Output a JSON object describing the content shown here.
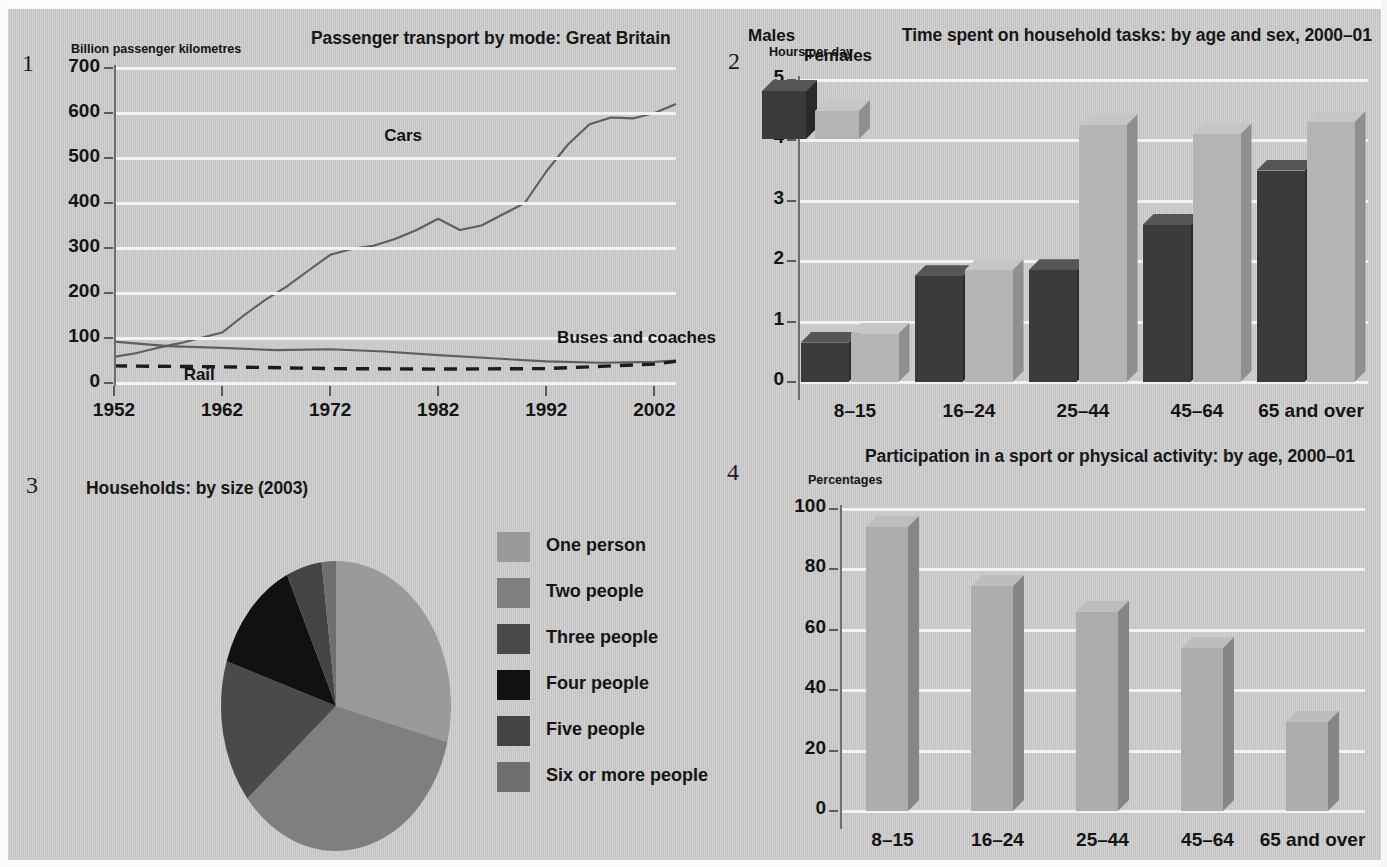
{
  "page": {
    "background_color": "#c9c9c9",
    "text_color": "#161616"
  },
  "panels": [
    {
      "number": "1"
    },
    {
      "number": "2"
    },
    {
      "number": "3"
    },
    {
      "number": "4"
    }
  ],
  "chart_data": [
    {
      "panel": "1",
      "type": "line",
      "title": "Passenger transport by mode: Great Britain",
      "ylabel": "Billion passenger kilometres",
      "xlabel": "",
      "ylim": [
        0,
        700
      ],
      "yticks": [
        "0",
        "100",
        "200",
        "300",
        "400",
        "500",
        "600",
        "700"
      ],
      "xticks": [
        "1952",
        "1962",
        "1972",
        "1982",
        "1992",
        "2002"
      ],
      "grid": true,
      "legend_position": "inline-annotations",
      "series": [
        {
          "name": "Cars",
          "style": "solid",
          "color": "#5e5e5e",
          "x": [
            1952,
            1954,
            1956,
            1958,
            1960,
            1962,
            1964,
            1966,
            1968,
            1970,
            1972,
            1974,
            1976,
            1978,
            1980,
            1982,
            1984,
            1986,
            1988,
            1990,
            1992,
            1994,
            1996,
            1998,
            2000,
            2002,
            2004
          ],
          "values": [
            58,
            66,
            78,
            88,
            100,
            112,
            150,
            185,
            215,
            250,
            285,
            298,
            305,
            320,
            340,
            365,
            340,
            350,
            375,
            400,
            470,
            530,
            575,
            590,
            588,
            600,
            620
          ]
        },
        {
          "name": "Buses and coaches",
          "style": "solid",
          "color": "#5e5e5e",
          "x": [
            1952,
            1957,
            1962,
            1967,
            1972,
            1977,
            1982,
            1987,
            1992,
            1997,
            2002,
            2004
          ],
          "values": [
            92,
            82,
            78,
            73,
            75,
            70,
            62,
            55,
            48,
            45,
            47,
            50
          ]
        },
        {
          "name": "Rail",
          "style": "dashed",
          "color": "#1c1c1c",
          "x": [
            1952,
            1962,
            1972,
            1982,
            1992,
            2002,
            2004
          ],
          "values": [
            38,
            36,
            32,
            31,
            32,
            42,
            48
          ]
        }
      ],
      "annotations": [
        {
          "text": "Cars",
          "x": 1977,
          "y": 545
        },
        {
          "text": "Buses and coaches",
          "x": 1993,
          "y": 95
        },
        {
          "text": "Rail",
          "x": 1959,
          "y": 14
        }
      ]
    },
    {
      "panel": "2",
      "type": "bar",
      "title": "Time spent on household tasks: by age and sex, 2000–01",
      "ylabel": "Hours per day",
      "xlabel": "",
      "ylim": [
        0,
        5
      ],
      "yticks": [
        "0",
        "1",
        "2",
        "3",
        "4",
        "5"
      ],
      "categories": [
        "8–15",
        "16–24",
        "25–44",
        "45–64",
        "65 and over"
      ],
      "grid": true,
      "legend_position": "top-left",
      "series": [
        {
          "name": "Males",
          "color": "#3b3b3b",
          "side_color": "#2a2a2a",
          "top_color": "#565656",
          "values": [
            0.65,
            1.75,
            1.85,
            2.6,
            3.5
          ]
        },
        {
          "name": "Females",
          "color": "#b4b4b4",
          "side_color": "#8f8f8f",
          "top_color": "#c6c6c6",
          "values": [
            0.8,
            1.85,
            4.25,
            4.1,
            4.3
          ]
        }
      ]
    },
    {
      "panel": "3",
      "type": "pie",
      "title": "Households: by size (2003)",
      "legend_position": "right",
      "labels": [
        "One person",
        "Two people",
        "Three people",
        "Four people",
        "Five people",
        "Six or more people"
      ],
      "values": [
        29,
        35,
        16,
        13,
        5,
        2
      ],
      "colors": [
        "#9a9a9a",
        "#7f7f7f",
        "#4a4a4a",
        "#111111",
        "#444444",
        "#6f6f6f"
      ]
    },
    {
      "panel": "4",
      "type": "bar",
      "title": "Participation in a sport or physical activity: by age, 2000–01",
      "ylabel": "Percentages",
      "xlabel": "",
      "ylim": [
        0,
        100
      ],
      "yticks": [
        "0",
        "20",
        "40",
        "60",
        "80",
        "100"
      ],
      "categories": [
        "8–15",
        "16–24",
        "25–44",
        "45–64",
        "65 and over"
      ],
      "grid": true,
      "series": [
        {
          "name": "Percentages",
          "color": "#adadad",
          "side_color": "#868686",
          "top_color": "#bdbdbd",
          "values": [
            94,
            74.5,
            66,
            54,
            29.5
          ]
        }
      ]
    }
  ]
}
